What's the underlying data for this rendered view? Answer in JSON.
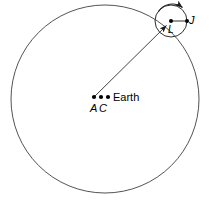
{
  "figure": {
    "background_color": "#ffffff",
    "stroke_color": "#3a3a3a",
    "text_color": "#000000",
    "width": 209,
    "height": 203
  },
  "labels": {
    "earth": "Earth",
    "equant": "A",
    "deferent_center": "C",
    "epicycle_point": "J",
    "epicycle_center": "L"
  },
  "geometry": {
    "deferent": {
      "name": "deferent-circle",
      "center_x": 105,
      "center_y": 99,
      "radius": 94
    },
    "epicycle": {
      "name": "epicycle-circle",
      "center_x": 171,
      "center_y": 21,
      "radius": 16
    },
    "points": [
      {
        "name": "A",
        "x": 94,
        "y": 97
      },
      {
        "name": "C",
        "x": 101,
        "y": 97
      },
      {
        "name": "Earth",
        "x": 108,
        "y": 97
      },
      {
        "name": "L",
        "x": 171,
        "y": 21
      },
      {
        "name": "J",
        "x": 187,
        "y": 21
      }
    ],
    "radius_line": {
      "name": "equant-to-epicycle-line",
      "x1": 94,
      "y1": 97,
      "x2": 171,
      "y2": 21
    },
    "epicycle_radius_line": {
      "name": "epicycle-radius-line",
      "x1": 171,
      "y1": 21,
      "x2": 187,
      "y2": 21
    },
    "motion_arrow_inner": {
      "name": "inner-direction-arrow",
      "description": "arrowhead on deferent radius pointing toward epicycle center"
    },
    "motion_arrow_outer": {
      "name": "epicycle-rotation-arrow",
      "description": "curved arrow above epicycle indicating rotation direction"
    }
  }
}
